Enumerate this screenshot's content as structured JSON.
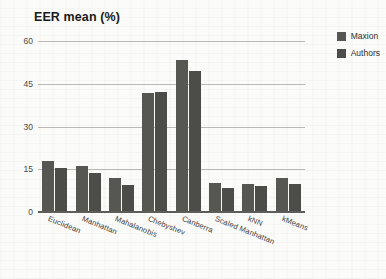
{
  "chart_data": {
    "type": "bar",
    "title": "EER mean (%)",
    "xlabel": "",
    "ylabel": "",
    "ylim": [
      0,
      60
    ],
    "yticks": [
      0,
      15,
      30,
      45,
      60
    ],
    "grid": true,
    "legend_position": "top-right",
    "categories": [
      "Euclidean",
      "Manhattan",
      "Mahalanobis",
      "Chebyshev",
      "Canberra",
      "Scaled Manhattan",
      "kNN",
      "kMeans"
    ],
    "series": [
      {
        "name": "Maxion",
        "color": "#565653",
        "values": [
          18.0,
          16.2,
          11.8,
          41.8,
          53.5,
          10.2,
          9.8,
          11.9
        ]
      },
      {
        "name": "Authors",
        "color": "#4c4c49",
        "values": [
          15.4,
          13.8,
          9.5,
          42.0,
          49.5,
          8.3,
          9.0,
          10.0
        ]
      }
    ]
  },
  "legend": {
    "items": [
      {
        "label": "Maxion"
      },
      {
        "label": "Authors"
      }
    ]
  }
}
